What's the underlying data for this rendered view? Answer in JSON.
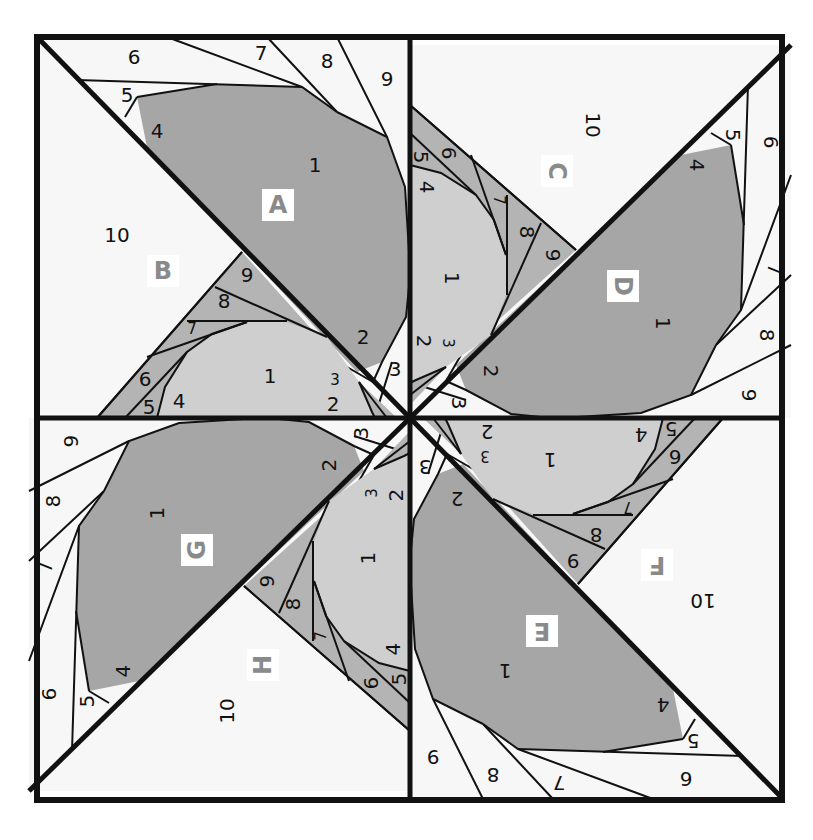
{
  "diagram": {
    "type": "quilt-block-paper-piecing",
    "colors": {
      "white": "#f7f7f7",
      "dark_gray": "#a6a6a6",
      "light_gray": "#cfcfcf",
      "mid_gray": "#b4b4b4",
      "line": "#111111",
      "letter_gray": "#8a8a8a"
    },
    "quadrants": [
      {
        "id": "top-left",
        "rotation": 0,
        "sections": [
          {
            "letter": "A",
            "pieces": [
              "1",
              "2",
              "3",
              "4",
              "5",
              "6",
              "7",
              "8",
              "9"
            ]
          },
          {
            "letter": "B",
            "pieces": [
              "1",
              "2",
              "3",
              "4",
              "5",
              "6",
              "7",
              "8",
              "9",
              "10"
            ]
          }
        ]
      },
      {
        "id": "top-right",
        "rotation": 90,
        "sections": [
          {
            "letter": "D",
            "pieces": [
              "1",
              "2",
              "3",
              "4",
              "5",
              "6",
              "7",
              "8",
              "9"
            ]
          },
          {
            "letter": "C",
            "pieces": [
              "1",
              "2",
              "3",
              "4",
              "5",
              "6",
              "7",
              "8",
              "9",
              "10"
            ]
          }
        ]
      },
      {
        "id": "bottom-right",
        "rotation": 180,
        "sections": [
          {
            "letter": "E",
            "pieces": [
              "1",
              "2",
              "3",
              "4",
              "5",
              "6",
              "7",
              "8",
              "9"
            ]
          },
          {
            "letter": "F",
            "pieces": [
              "1",
              "2",
              "3",
              "4",
              "5",
              "6",
              "7",
              "8",
              "9",
              "10"
            ]
          }
        ]
      },
      {
        "id": "bottom-left",
        "rotation": 270,
        "sections": [
          {
            "letter": "G",
            "pieces": [
              "1",
              "2",
              "3",
              "4",
              "5",
              "6",
              "7",
              "8",
              "9"
            ]
          },
          {
            "letter": "H",
            "pieces": [
              "1",
              "2",
              "3",
              "4",
              "5",
              "6",
              "7",
              "8",
              "9",
              "10"
            ]
          }
        ]
      }
    ],
    "labels": {
      "q0": {
        "A": "A",
        "B": "B",
        "a1": "1",
        "a2": "2",
        "a3": "3",
        "a4": "4",
        "a5": "5",
        "a6": "6",
        "a7": "7",
        "a8": "8",
        "a9": "9",
        "b1": "1",
        "b2": "2",
        "b3": "3",
        "b4": "4",
        "b5": "5",
        "b6": "6",
        "b7": "7",
        "b8": "8",
        "b9": "9",
        "b10": "10"
      },
      "q1": {
        "A": "D",
        "B": "C",
        "a1": "1",
        "a2": "2",
        "a3": "3",
        "a4": "4",
        "a5": "5",
        "a6": "6",
        "a7": "7",
        "a8": "8",
        "a9": "9",
        "b1": "1",
        "b2": "2",
        "b3": "3",
        "b4": "4",
        "b5": "5",
        "b6": "6",
        "b7": "7",
        "b8": "8",
        "b9": "9",
        "b10": "10"
      },
      "q2": {
        "A": "E",
        "B": "F",
        "a1": "1",
        "a2": "2",
        "a3": "3",
        "a4": "4",
        "a5": "5",
        "a6": "6",
        "a7": "7",
        "a8": "8",
        "a9": "9",
        "b1": "1",
        "b2": "2",
        "b3": "3",
        "b4": "4",
        "b5": "5",
        "b6": "6",
        "b7": "7",
        "b8": "8",
        "b9": "9",
        "b10": "10"
      },
      "q3": {
        "A": "G",
        "B": "H",
        "a1": "1",
        "a2": "2",
        "a3": "3",
        "a4": "4",
        "a5": "5",
        "a6": "6",
        "a7": "7",
        "a8": "8",
        "a9": "9",
        "b1": "1",
        "b2": "2",
        "b3": "3",
        "b4": "4",
        "b5": "5",
        "b6": "6",
        "b7": "7",
        "b8": "8",
        "b9": "9",
        "b10": "10"
      }
    }
  }
}
